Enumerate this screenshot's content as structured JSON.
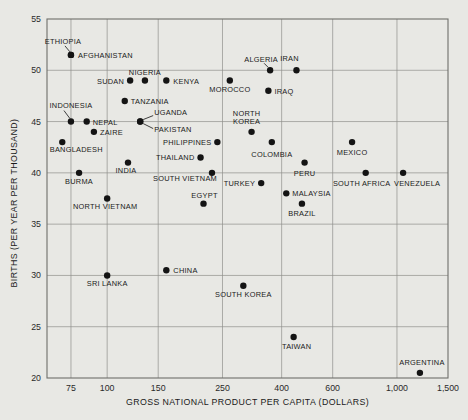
{
  "page": {
    "background": "#e8e8e4"
  },
  "chart_data": {
    "type": "scatter",
    "title": "",
    "xlabel": "GROSS NATIONAL PRODUCT PER CAPITA (DOLLARS)",
    "ylabel": "BIRTHS (PER YEAR PER THOUSAND)",
    "x_scale": "log",
    "x_domain": [
      62,
      1500
    ],
    "y_domain": [
      20,
      55
    ],
    "grid": true,
    "x_ticks": [
      {
        "value": 75,
        "label": "75"
      },
      {
        "value": 100,
        "label": "100"
      },
      {
        "value": 150,
        "label": "150"
      },
      {
        "value": 250,
        "label": "250"
      },
      {
        "value": 400,
        "label": "400"
      },
      {
        "value": 600,
        "label": "600"
      },
      {
        "value": 1000,
        "label": "1,000"
      },
      {
        "value": 1500,
        "label": "1,500"
      }
    ],
    "y_ticks": [
      55,
      50,
      45,
      40,
      35,
      30,
      25,
      20
    ],
    "colors": {
      "point": "#141414",
      "grid": "#8f8f8b",
      "border": "#6e6e6a",
      "text": "#1a1a1a",
      "connector": "#2b2b2b"
    },
    "points": [
      {
        "name": "ETHIOPIA",
        "gnp": 75,
        "births": 51.5,
        "label": {
          "dx": -8,
          "dy": -11,
          "anchor": "middle"
        },
        "connector": [
          -1,
          -3,
          -6,
          -9
        ]
      },
      {
        "name": "AFGHANISTAN",
        "gnp": 75,
        "births": 51.5,
        "label": {
          "dx": 7,
          "dy": 3,
          "anchor": "start"
        }
      },
      {
        "name": "SUDAN",
        "gnp": 120,
        "births": 49,
        "label": {
          "dx": -6,
          "dy": 3,
          "anchor": "end"
        }
      },
      {
        "name": "NIGERIA",
        "gnp": 135,
        "births": 49,
        "label": {
          "dx": 0,
          "dy": -6,
          "anchor": "middle"
        }
      },
      {
        "name": "KENYA",
        "gnp": 160,
        "births": 49,
        "label": {
          "dx": 7,
          "dy": 3,
          "anchor": "start"
        }
      },
      {
        "name": "MOROCCO",
        "gnp": 265,
        "births": 49,
        "label": {
          "dx": 0,
          "dy": 11,
          "anchor": "middle"
        }
      },
      {
        "name": "ALGERIA",
        "gnp": 365,
        "births": 50,
        "label": {
          "dx": -9,
          "dy": -8,
          "anchor": "middle"
        },
        "connector": [
          -2,
          -3,
          -6,
          -7
        ]
      },
      {
        "name": "IRAN",
        "gnp": 450,
        "births": 50,
        "label": {
          "dx": -7,
          "dy": -9,
          "anchor": "middle"
        }
      },
      {
        "name": "IRAQ",
        "gnp": 360,
        "births": 48,
        "label": {
          "dx": 6,
          "dy": 3,
          "anchor": "start"
        }
      },
      {
        "name": "INDONESIA",
        "gnp": 75,
        "births": 45,
        "label": {
          "dx": 0,
          "dy": -14,
          "anchor": "middle"
        },
        "connector": [
          -1,
          -3,
          -7,
          -11
        ]
      },
      {
        "name": "NEPAL",
        "gnp": 85,
        "births": 45,
        "label": {
          "dx": 6,
          "dy": 3,
          "anchor": "start"
        }
      },
      {
        "name": "ZAIRE",
        "gnp": 90,
        "births": 44,
        "label": {
          "dx": 6,
          "dy": 3,
          "anchor": "start"
        }
      },
      {
        "name": "TANZANIA",
        "gnp": 115,
        "births": 47,
        "label": {
          "dx": 6,
          "dy": 3,
          "anchor": "start"
        }
      },
      {
        "name": "UGANDA",
        "gnp": 130,
        "births": 45,
        "label": {
          "dx": 14,
          "dy": -7,
          "anchor": "start"
        },
        "connector": [
          3,
          -2,
          13,
          -6
        ]
      },
      {
        "name": "PAKISTAN",
        "gnp": 130,
        "births": 45,
        "label": {
          "dx": 14,
          "dy": 10,
          "anchor": "start"
        },
        "connector": [
          3,
          2,
          13,
          7
        ]
      },
      {
        "name": "BANGLADESH",
        "gnp": 70,
        "births": 43,
        "label": {
          "dx": 14,
          "dy": 10,
          "anchor": "middle"
        }
      },
      {
        "name": "BURMA",
        "gnp": 80,
        "births": 40,
        "label": {
          "dx": 0,
          "dy": 11,
          "anchor": "middle"
        }
      },
      {
        "name": "INDIA",
        "gnp": 118,
        "births": 41,
        "label": {
          "dx": -2,
          "dy": 10,
          "anchor": "middle"
        }
      },
      {
        "name": "NORTH VIETNAM",
        "gnp": 100,
        "births": 37.5,
        "label": {
          "dx": -2,
          "dy": 10,
          "anchor": "middle"
        }
      },
      {
        "name": "PHILIPPINES",
        "gnp": 240,
        "births": 43,
        "label": {
          "dx": -6,
          "dy": 3,
          "anchor": "end"
        }
      },
      {
        "name": "THAILAND",
        "gnp": 210,
        "births": 41.5,
        "label": {
          "dx": -6,
          "dy": 3,
          "anchor": "end"
        }
      },
      {
        "name": "SOUTH VIETNAM",
        "gnp": 230,
        "births": 40,
        "label": {
          "dx": 5,
          "dy": 8,
          "anchor": "end"
        }
      },
      {
        "name": "EGYPT",
        "gnp": 215,
        "births": 37,
        "label": {
          "dx": 1,
          "dy": -6,
          "anchor": "middle"
        }
      },
      {
        "name": "TURKEY",
        "gnp": 340,
        "births": 39,
        "label": {
          "dx": -6,
          "dy": 3,
          "anchor": "end"
        }
      },
      {
        "name": "NORTH KOREA",
        "gnp": 315,
        "births": 44,
        "label": {
          "dx": -5,
          "dy": -16,
          "anchor": "middle",
          "lines": [
            "NORTH",
            "KOREA"
          ]
        }
      },
      {
        "name": "COLOMBIA",
        "gnp": 370,
        "births": 43,
        "label": {
          "dx": 0,
          "dy": 15,
          "anchor": "middle"
        }
      },
      {
        "name": "MEXICO",
        "gnp": 700,
        "births": 43,
        "label": {
          "dx": 0,
          "dy": 13,
          "anchor": "middle"
        }
      },
      {
        "name": "PERU",
        "gnp": 480,
        "births": 41,
        "label": {
          "dx": 0,
          "dy": 13,
          "anchor": "middle"
        }
      },
      {
        "name": "MALAYSIA",
        "gnp": 415,
        "births": 38,
        "label": {
          "dx": 6,
          "dy": 3,
          "anchor": "start"
        }
      },
      {
        "name": "BRAZIL",
        "gnp": 470,
        "births": 37,
        "label": {
          "dx": 0,
          "dy": 12,
          "anchor": "middle"
        }
      },
      {
        "name": "SOUTH AFRICA",
        "gnp": 780,
        "births": 40,
        "label": {
          "dx": -4,
          "dy": 13,
          "anchor": "middle"
        }
      },
      {
        "name": "VENEZUELA",
        "gnp": 1050,
        "births": 40,
        "label": {
          "dx": 14,
          "dy": 13,
          "anchor": "middle"
        }
      },
      {
        "name": "CHINA",
        "gnp": 160,
        "births": 30.5,
        "label": {
          "dx": 7,
          "dy": 3,
          "anchor": "start"
        }
      },
      {
        "name": "SRI LANKA",
        "gnp": 100,
        "births": 30,
        "label": {
          "dx": 0,
          "dy": 11,
          "anchor": "middle"
        }
      },
      {
        "name": "SOUTH KOREA",
        "gnp": 295,
        "births": 29,
        "label": {
          "dx": 0,
          "dy": 11,
          "anchor": "middle"
        }
      },
      {
        "name": "TAIWAN",
        "gnp": 440,
        "births": 24,
        "label": {
          "dx": 3,
          "dy": 12,
          "anchor": "middle"
        }
      },
      {
        "name": "ARGENTINA",
        "gnp": 1200,
        "births": 20.5,
        "label": {
          "dx": 2,
          "dy": -8,
          "anchor": "middle"
        }
      }
    ]
  }
}
